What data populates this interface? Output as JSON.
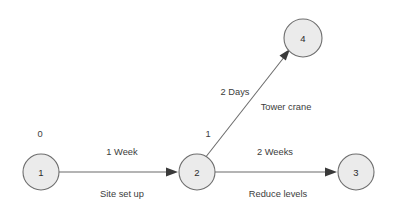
{
  "diagram": {
    "type": "activity-on-arrow-network",
    "background_color": "#ffffff",
    "node_fill_color": "#ebebeb",
    "node_stroke_color": "#6e6e6e",
    "line_color": "#6b6b6b",
    "text_color": "#3c3c3c",
    "nodes": [
      {
        "id": "1",
        "label": "1",
        "cx": 41,
        "cy": 172,
        "r": 18,
        "earliest_time": "0",
        "time_x": 40,
        "time_y": 134
      },
      {
        "id": "2",
        "label": "2",
        "cx": 197,
        "cy": 172,
        "r": 18,
        "earliest_time": "1",
        "time_x": 208,
        "time_y": 134
      },
      {
        "id": "3",
        "label": "3",
        "cx": 356,
        "cy": 172,
        "r": 18,
        "earliest_time": "",
        "time_x": 0,
        "time_y": 0
      },
      {
        "id": "4",
        "label": "4",
        "cx": 303,
        "cy": 38,
        "r": 19,
        "earliest_time": "",
        "time_x": 0,
        "time_y": 0
      }
    ],
    "edges": [
      {
        "id": "edge-1-2",
        "from": "1",
        "to": "2",
        "duration": "1 Week",
        "activity": "Site set up",
        "duration_x": 122,
        "duration_y": 152,
        "activity_x": 122,
        "activity_y": 194,
        "x1": 59,
        "y1": 172,
        "x2": 173,
        "y2": 172
      },
      {
        "id": "edge-2-3",
        "from": "2",
        "to": "3",
        "duration": "2 Weeks",
        "activity": "Reduce levels",
        "duration_x": 275,
        "duration_y": 152,
        "activity_x": 278,
        "activity_y": 194,
        "x1": 215,
        "y1": 172,
        "x2": 332,
        "y2": 172
      },
      {
        "id": "edge-2-4",
        "from": "2",
        "to": "4",
        "duration": "2 Days",
        "activity": "Tower crane",
        "duration_x": 235,
        "duration_y": 92,
        "activity_x": 286,
        "activity_y": 107,
        "x1": 205,
        "y1": 157,
        "x2": 288,
        "y2": 52
      }
    ]
  }
}
